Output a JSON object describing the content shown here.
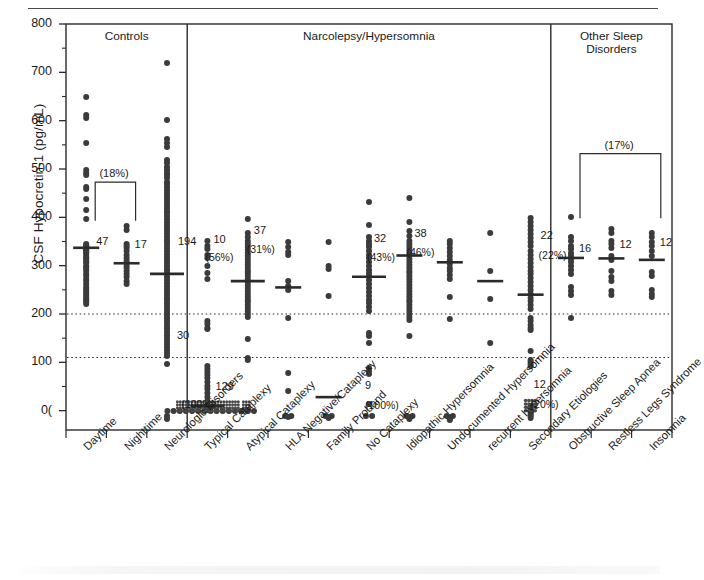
{
  "figure": {
    "yaxis_title": "CSF Hypocretin-1 (pg/mL)",
    "y_ticks": [
      "800",
      "700",
      "600",
      "500",
      "400",
      "300",
      "200",
      "100",
      "0("
    ],
    "panels": [
      {
        "id": "controls",
        "title": "Controls"
      },
      {
        "id": "narcolepsy",
        "title": "Narcolepsy/Hypersomnia"
      },
      {
        "id": "other",
        "title_line1": "Other Sleep",
        "title_line2": "Disorders"
      }
    ],
    "bracket_labels": [
      {
        "id": "controls-bracket",
        "text": "(18%)"
      },
      {
        "id": "other-bracket",
        "text": "(17%)"
      }
    ]
  },
  "chart_data": {
    "type": "scatter",
    "title": "",
    "xlabel": "",
    "ylabel": "CSF Hypocretin-1 (pg/mL)",
    "ylim": [
      -40,
      800
    ],
    "yticks": [
      0,
      100,
      200,
      300,
      400,
      500,
      600,
      700,
      800
    ],
    "minor_tick_interval": 50,
    "grid": false,
    "reference_lines": [
      {
        "value": 200,
        "style": "dotted"
      },
      {
        "value": 110,
        "style": "dotted"
      }
    ],
    "panels": [
      {
        "name": "Controls",
        "categories": [
          "Daytime",
          "Nighttime",
          "Neurologic Disorders"
        ]
      },
      {
        "name": "Narcolepsy/Hypersomnia",
        "categories": [
          "Typical Cataplexy",
          "Atypical Cataplexy",
          "HLA Negative/Cataplexy",
          "Family Proband",
          "No Cataplexy",
          "Idiopathic Hypersomnia",
          "Undocumented Hypersomnia",
          "recurrent hypersomnia",
          "Secondary Etiologies"
        ]
      },
      {
        "name": "Other Sleep Disorders",
        "categories": [
          "Obstructive Sleep Apnea",
          "Restless Legs Syndrome",
          "Insomnia"
        ]
      }
    ],
    "categories": [
      "Daytime",
      "Nighttime",
      "Neurologic Disorders",
      "Typical Cataplexy",
      "Atypical Cataplexy",
      "HLA Negative/Cataplexy",
      "Family Proband",
      "No Cataplexy",
      "Idiopathic Hypersomnia",
      "Undocumented Hypersomnia",
      "recurrent hypersomnia",
      "Secondary Etiologies",
      "Obstructive Sleep Apnea",
      "Restless Legs Syndrome",
      "Insomnia"
    ],
    "groups": [
      {
        "category": "Daytime",
        "panel": "Controls",
        "n_label": "47",
        "pct_label": "",
        "median": 337,
        "values": [
          650,
          612,
          605,
          553,
          497,
          492,
          487,
          463,
          458,
          437,
          415,
          397,
          345,
          342,
          340,
          338,
          336,
          334,
          332,
          330,
          328,
          326,
          322,
          318,
          316,
          312,
          308,
          305,
          300,
          297,
          293,
          288,
          283,
          278,
          273,
          268,
          262,
          256,
          252,
          248,
          244,
          240,
          236,
          232,
          228,
          224,
          220
        ]
      },
      {
        "category": "Nighttime",
        "panel": "Controls",
        "n_label": "17",
        "pct_label": "",
        "median": 305,
        "values": [
          382,
          374,
          345,
          341,
          337,
          330,
          322,
          316,
          310,
          305,
          300,
          295,
          289,
          282,
          276,
          268,
          262
        ]
      },
      {
        "category": "Neurologic Disorders",
        "panel": "Controls",
        "n_label": "194",
        "secondary_n_label": "30",
        "pct_label": "",
        "median": 283,
        "values": [
          720,
          602,
          562,
          553,
          545,
          519,
          512,
          505,
          498,
          492,
          487,
          481,
          474,
          468,
          462,
          456,
          450,
          444,
          438,
          432,
          426,
          420,
          414,
          408,
          402,
          396,
          390,
          384,
          378,
          372,
          366,
          360,
          354,
          348,
          342,
          336,
          330,
          324,
          318,
          312,
          306,
          300,
          294,
          288,
          282,
          276,
          270,
          264,
          258,
          252,
          246,
          240,
          234,
          228,
          222,
          216,
          210,
          204,
          198,
          192,
          186,
          180,
          174,
          168,
          162,
          156,
          150,
          144,
          138,
          132,
          126,
          120,
          114,
          96,
          -12,
          -18
        ]
      },
      {
        "category": "Typical Cataplexy",
        "panel": "Narcolepsy/Hypersomnia",
        "n_label": "10",
        "pct_label": "(56%)",
        "n_label_low": "129",
        "pct_label_low": "(100%)",
        "median": 10,
        "values": [
          352,
          340,
          335,
          322,
          315,
          300,
          285,
          272,
          186,
          180,
          172,
          168,
          92,
          86,
          80,
          74,
          68,
          60,
          52,
          44,
          36,
          28,
          20,
          12,
          6,
          2,
          0,
          0,
          0,
          0,
          0,
          0,
          0,
          0,
          0,
          0,
          0,
          0,
          0,
          0
        ]
      },
      {
        "category": "Atypical Cataplexy",
        "panel": "Narcolepsy/Hypersomnia",
        "n_label": "37",
        "pct_label": "(31%)",
        "median": 268,
        "values": [
          396,
          368,
          360,
          352,
          345,
          338,
          332,
          326,
          320,
          314,
          308,
          302,
          296,
          290,
          284,
          278,
          272,
          266,
          260,
          254,
          248,
          242,
          236,
          230,
          224,
          218,
          212,
          206,
          200,
          194,
          148,
          110,
          104,
          2,
          0,
          0,
          0
        ]
      },
      {
        "category": "HLA Negative/Cataplexy",
        "panel": "Narcolepsy/Hypersomnia",
        "n_label": "13",
        "pct_label": "(92%)",
        "median": 255,
        "values": [
          348,
          338,
          328,
          322,
          268,
          258,
          250,
          192,
          78,
          40,
          -10,
          -12,
          -14
        ]
      },
      {
        "category": "Family Proband",
        "panel": "Narcolepsy/Hypersomnia",
        "n_label": "",
        "pct_label": "",
        "median": 28,
        "values": [
          350,
          300,
          294,
          238,
          -10,
          -12,
          -14,
          -16
        ]
      },
      {
        "category": "No Cataplexy",
        "panel": "Narcolepsy/Hypersomnia",
        "n_label": "32",
        "pct_label": "(43%)",
        "n_label_low": "9",
        "pct_label_low": "(100%)",
        "median": 277,
        "values": [
          432,
          385,
          360,
          352,
          345,
          338,
          330,
          322,
          316,
          308,
          300,
          292,
          285,
          278,
          270,
          262,
          254,
          246,
          238,
          230,
          222,
          214,
          206,
          160,
          155,
          140,
          88,
          82,
          76,
          14,
          -10,
          -12
        ]
      },
      {
        "category": "Idiopathic Hypersomnia",
        "panel": "Narcolepsy/Hypersomnia",
        "n_label": "38",
        "pct_label": "(46%)",
        "median": 321,
        "values": [
          440,
          390,
          372,
          362,
          352,
          345,
          338,
          332,
          326,
          320,
          314,
          308,
          302,
          296,
          290,
          284,
          278,
          272,
          266,
          260,
          254,
          248,
          242,
          236,
          230,
          224,
          218,
          212,
          206,
          200,
          194,
          188,
          154,
          -10,
          -12,
          -14,
          -16,
          -18
        ]
      },
      {
        "category": "Undocumented Hypersomnia",
        "panel": "Narcolepsy/Hypersomnia",
        "n_label": "",
        "pct_label": "",
        "median": 307,
        "values": [
          352,
          344,
          336,
          328,
          320,
          312,
          304,
          296,
          288,
          280,
          272,
          236,
          190,
          -10,
          -12,
          -14,
          -16,
          -18,
          -20
        ]
      },
      {
        "category": "recurrent hypersomnia",
        "panel": "Narcolepsy/Hypersomnia",
        "n_label": "",
        "pct_label": "",
        "median": 268,
        "values": [
          368,
          290,
          232,
          140
        ]
      },
      {
        "category": "Secondary Etiologies",
        "panel": "Narcolepsy/Hypersomnia",
        "n_label": "22",
        "pct_label": "(22%)",
        "n_label_low": "12",
        "pct_label_low": "(20%)",
        "median": 240,
        "values": [
          398,
          390,
          382,
          374,
          366,
          358,
          350,
          340,
          330,
          322,
          314,
          306,
          298,
          290,
          282,
          274,
          266,
          258,
          250,
          242,
          234,
          226,
          218,
          210,
          192,
          186,
          178,
          172,
          166,
          124,
          104,
          100,
          96,
          92,
          10,
          4,
          0,
          -4,
          -8,
          -12,
          -16
        ]
      },
      {
        "category": "Obstructive Sleep Apnea",
        "panel": "Other Sleep Disorders",
        "n_label": "16",
        "pct_label": "",
        "median": 316,
        "values": [
          400,
          360,
          352,
          340,
          334,
          326,
          320,
          314,
          308,
          300,
          292,
          282,
          256,
          248,
          240,
          192
        ]
      },
      {
        "category": "Restless Legs Syndrome",
        "panel": "Other Sleep Disorders",
        "n_label": "12",
        "pct_label": "",
        "median": 315,
        "values": [
          375,
          368,
          352,
          344,
          336,
          320,
          312,
          288,
          276,
          268,
          248,
          240
        ]
      },
      {
        "category": "Insomnia",
        "panel": "Other Sleep Disorders",
        "n_label": "12",
        "pct_label": "",
        "median": 312,
        "values": [
          368,
          360,
          348,
          340,
          330,
          320,
          286,
          278,
          250,
          242,
          236
        ]
      }
    ]
  }
}
